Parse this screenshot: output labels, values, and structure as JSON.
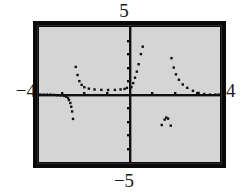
{
  "screen": {
    "kind": "graphing-calculator-screen",
    "background_color": "#ffffff",
    "frame_color": "#0a0a0a",
    "plot_background_color": "#d5d5d5",
    "plot_ink_color": "#111111"
  },
  "labels": {
    "y_max": "5",
    "y_min": "−5",
    "x_min": "−4",
    "x_max": "4"
  },
  "chart_data": {
    "type": "scatter",
    "title": "",
    "xlabel": "",
    "ylabel": "",
    "xlim": [
      -4,
      4
    ],
    "ylim": [
      -5,
      5
    ],
    "grid": false,
    "legend": null,
    "axes": {
      "x_axis_visible": true,
      "y_axis_visible": true,
      "x_tick_interval": 1,
      "y_tick_interval": 1,
      "x_ticks": [
        -3,
        -2,
        -1,
        1,
        2,
        3
      ],
      "y_ticks": [
        -4,
        -3,
        -2,
        -1,
        1,
        2,
        3,
        4
      ],
      "tick_style": "dot-mark"
    },
    "render_style": "dotted-pixel-plot",
    "series": [
      {
        "name": "branch-left-flat",
        "comment": "near-zero values hugging the x-axis at the far left",
        "points": [
          [
            -3.95,
            0.0
          ],
          [
            -3.8,
            0.0
          ],
          [
            -3.65,
            0.0
          ],
          [
            -3.5,
            0.0
          ],
          [
            -3.35,
            -0.02
          ],
          [
            -3.2,
            -0.04
          ],
          [
            -3.05,
            -0.06
          ],
          [
            -2.9,
            -0.1
          ],
          [
            -2.8,
            -0.15
          ],
          [
            -2.72,
            -0.25
          ]
        ]
      },
      {
        "name": "branch-left-descending",
        "comment": "steep drop to negative values approaching the asymptote",
        "points": [
          [
            -2.68,
            -0.4
          ],
          [
            -2.62,
            -0.62
          ],
          [
            -2.58,
            -0.9
          ],
          [
            -2.54,
            -1.25
          ],
          [
            -2.5,
            -1.8
          ]
        ]
      },
      {
        "name": "branch-valley",
        "comment": "U-shaped valley between the asymptotes, minimum near y=0.35",
        "points": [
          [
            -2.38,
            2.05
          ],
          [
            -2.3,
            1.45
          ],
          [
            -2.22,
            1.0
          ],
          [
            -2.12,
            0.72
          ],
          [
            -2.0,
            0.55
          ],
          [
            -1.8,
            0.44
          ],
          [
            -1.55,
            0.38
          ],
          [
            -1.25,
            0.35
          ],
          [
            -0.95,
            0.34
          ],
          [
            -0.65,
            0.35
          ],
          [
            -0.4,
            0.38
          ],
          [
            -0.22,
            0.42
          ],
          [
            -0.12,
            0.5
          ]
        ]
      },
      {
        "name": "branch-right-of-origin-rising",
        "comment": "steep rise immediately to the right of the y-axis",
        "points": [
          [
            0.08,
            0.55
          ],
          [
            0.16,
            0.85
          ],
          [
            0.24,
            1.25
          ],
          [
            0.32,
            1.7
          ],
          [
            0.4,
            2.25
          ],
          [
            0.5,
            3.0
          ],
          [
            0.58,
            3.55
          ]
        ]
      },
      {
        "name": "branch-right-spike",
        "comment": "tall spike falling away to the right and flattening onto the axis",
        "points": [
          [
            1.85,
            2.7
          ],
          [
            1.95,
            2.0
          ],
          [
            2.05,
            1.5
          ],
          [
            2.18,
            1.1
          ],
          [
            2.35,
            0.75
          ],
          [
            2.55,
            0.5
          ],
          [
            2.8,
            0.28
          ],
          [
            3.05,
            0.12
          ],
          [
            3.3,
            0.04
          ],
          [
            3.55,
            0.0
          ],
          [
            3.8,
            0.0
          ],
          [
            3.95,
            0.0
          ]
        ]
      },
      {
        "name": "lower-arc-cluster",
        "comment": "small isolated arc of dots below the x-axis",
        "points": [
          [
            1.42,
            -2.25
          ],
          [
            1.55,
            -1.85
          ],
          [
            1.62,
            -1.7
          ],
          [
            1.7,
            -1.78
          ],
          [
            1.82,
            -2.3
          ]
        ]
      }
    ]
  }
}
